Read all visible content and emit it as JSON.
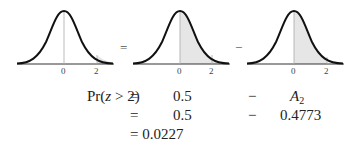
{
  "figure": {
    "curves": [
      {
        "id": "left",
        "shaded_region": "z > 2",
        "ticks": [
          "0",
          "2"
        ]
      },
      {
        "id": "middle",
        "shaded_region": "z > 0",
        "ticks": [
          "0",
          "2"
        ]
      },
      {
        "id": "right",
        "shaded_region": "0 < z < 2",
        "ticks": [
          "0",
          "2"
        ]
      }
    ],
    "operators": [
      "=",
      "−"
    ],
    "shade_color": "#e6e6e6",
    "curve_color": "#111111"
  },
  "equations": {
    "row1": {
      "lhs_prefix": "Pr(",
      "lhs_var": "z",
      "lhs_suffix": " > 2)",
      "eq": "=",
      "term1": "0.5",
      "op": "−",
      "term2_base": "A",
      "term2_sub": "2"
    },
    "row2": {
      "eq": "=",
      "term1": "0.5",
      "op": "−",
      "term2": "0.4773"
    },
    "row3": {
      "result": "= 0.0227"
    }
  }
}
